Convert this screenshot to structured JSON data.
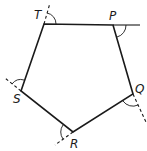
{
  "figure": {
    "type": "pentagon-exterior-angles",
    "vertices": [
      {
        "label": "T",
        "x": 44,
        "y": 24,
        "label_x": 34,
        "label_y": 19
      },
      {
        "label": "P",
        "x": 113,
        "y": 25,
        "label_x": 109,
        "label_y": 20
      },
      {
        "label": "Q",
        "x": 133,
        "y": 94,
        "label_x": 135,
        "label_y": 93
      },
      {
        "label": "R",
        "x": 73,
        "y": 132,
        "label_x": 70,
        "label_y": 148
      },
      {
        "label": "S",
        "x": 21,
        "y": 91,
        "label_x": 13,
        "label_y": 103
      }
    ],
    "labels": {
      "T": "T",
      "P": "P",
      "Q": "Q",
      "R": "R",
      "S": "S"
    },
    "extensions": [
      {
        "at": "T",
        "from": "S",
        "style": "dashed",
        "end": [
          50,
          3
        ]
      },
      {
        "at": "P",
        "from": "T",
        "style": "solid",
        "end": [
          140,
          25
        ]
      },
      {
        "at": "Q",
        "from": "P",
        "style": "dashed",
        "end": [
          146,
          122
        ]
      },
      {
        "at": "R",
        "from": "Q",
        "style": "dashed",
        "end": [
          55,
          145
        ]
      },
      {
        "at": "S",
        "from": "R",
        "style": "dashed",
        "end": [
          5,
          78
        ]
      }
    ],
    "exterior_angle_marks": [
      "T",
      "P",
      "Q",
      "R",
      "S"
    ],
    "colors": {
      "stroke": "#1a1a1a",
      "background": "#ffffff"
    }
  }
}
